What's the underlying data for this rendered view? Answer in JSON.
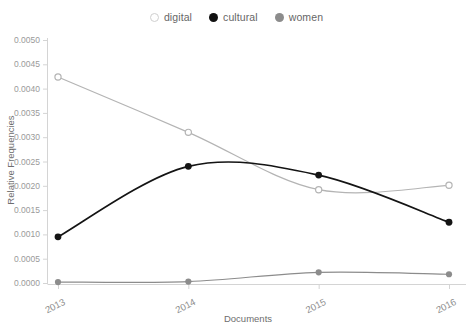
{
  "chart_data": {
    "type": "line",
    "title": "",
    "xlabel": "Documents",
    "ylabel": "Relative Frequencies",
    "categories": [
      "2013",
      "2014",
      "2015",
      "2016"
    ],
    "x": [
      2013,
      2014,
      2015,
      2016
    ],
    "ylim": [
      0.0,
      0.005
    ],
    "yticks": [
      "0.0000",
      "0.0005",
      "0.0010",
      "0.0015",
      "0.0020",
      "0.0025",
      "0.0030",
      "0.0035",
      "0.0040",
      "0.0045",
      "0.0050"
    ],
    "ytick_values": [
      0.0,
      0.0005,
      0.001,
      0.0015,
      0.002,
      0.0025,
      0.003,
      0.0035,
      0.004,
      0.0045,
      0.005
    ],
    "grid": false,
    "legend_position": "top-center",
    "smoothing": "spline",
    "series": [
      {
        "name": "digital",
        "color": "#b4b4b4",
        "marker": "open-circle",
        "values": [
          0.00424,
          0.0031,
          0.00192,
          0.00201
        ]
      },
      {
        "name": "cultural",
        "color": "#141414",
        "marker": "filled-circle",
        "values": [
          0.00095,
          0.0024,
          0.00222,
          0.00125
        ]
      },
      {
        "name": "women",
        "color": "#8c8c8c",
        "marker": "filled-circle",
        "values": [
          2e-05,
          3e-05,
          0.00022,
          0.00018
        ]
      }
    ]
  },
  "legend": {
    "items": [
      {
        "label": "digital",
        "swatch": "open-circle-light"
      },
      {
        "label": "cultural",
        "swatch": "filled-circle-black"
      },
      {
        "label": "women",
        "swatch": "filled-circle-gray"
      }
    ]
  },
  "axes": {
    "y_title": "Relative Frequencies",
    "x_title": "Documents"
  },
  "colors": {
    "background": "#ffffff",
    "axis": "#d4d4d4",
    "tick_text": "#9a9a9a",
    "title_text": "#6e6e6e",
    "digital": "#b4b4b4",
    "cultural": "#141414",
    "women": "#8c8c8c"
  }
}
